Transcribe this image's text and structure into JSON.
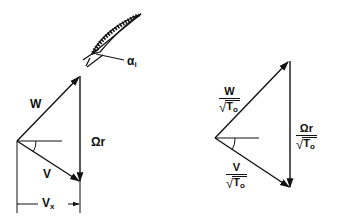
{
  "diagram": {
    "type": "velocity-triangles",
    "colors": {
      "ink": "#111111",
      "background": "#ffffff"
    },
    "blade": {
      "label": "α",
      "label_subscript": "i",
      "icon": "airfoil-blade-icon"
    },
    "left_triangle": {
      "labels": {
        "relative_velocity": "W",
        "blade_speed": "Ωr",
        "absolute_velocity": "V",
        "axial_velocity": "V",
        "axial_velocity_subscript": "x"
      }
    },
    "right_triangle": {
      "labels": {
        "relative_velocity_num": "W",
        "blade_speed_num": "Ωr",
        "absolute_velocity_num": "V",
        "denominator_var": "T",
        "denominator_subscript": "o"
      }
    }
  }
}
